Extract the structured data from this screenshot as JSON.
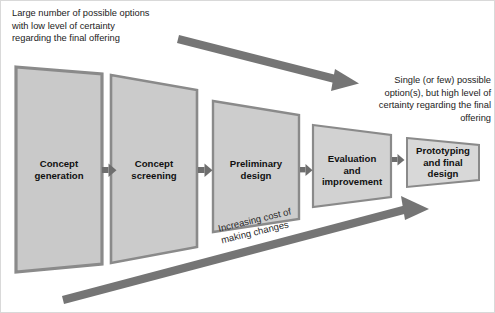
{
  "diagram": {
    "title_note_top_left": "Large number of possible options\nwith low level of certainty\nregarding the final offering",
    "title_note_top_right": "Single (or few) possible\noption(s), but high level of\ncertainty regarding the final\noffering",
    "cost_arrow_label": "Increasing cost of\nmaking changes",
    "colors": {
      "background": "#ffffff",
      "frame_border": "#d9d9d9",
      "arrow_gray": "#757575",
      "flow_arrow_gray": "#6e6e6e",
      "box_border": "#8a8a8a",
      "text_dark": "#111111"
    },
    "stages": [
      {
        "id": "concept-generation",
        "label": "Concept\ngeneration",
        "fill": "#c9c9c9"
      },
      {
        "id": "concept-screening",
        "label": "Concept\nscreening",
        "fill": "#cbcbcb"
      },
      {
        "id": "preliminary-design",
        "label": "Preliminary\ndesign",
        "fill": "#cdcdcd"
      },
      {
        "id": "evaluation-improvement",
        "label": "Evaluation\nand\nimprovement",
        "fill": "#d2d2d2"
      },
      {
        "id": "prototyping-final",
        "label": "Prototyping\nand final\ndesign",
        "fill": "#d8d8d8"
      }
    ],
    "arrows": {
      "certainty_arrow": "narrowing-options-arrow",
      "cost_arrow": "increasing-cost-arrow"
    }
  }
}
